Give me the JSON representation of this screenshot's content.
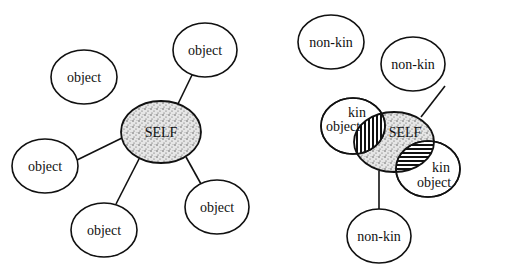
{
  "left_diagram": {
    "self_label": "SELF",
    "objects": [
      {
        "label": "object",
        "connected": false
      },
      {
        "label": "object",
        "connected": true
      },
      {
        "label": "object",
        "connected": true
      },
      {
        "label": "object",
        "connected": true
      },
      {
        "label": "object",
        "connected": true
      }
    ]
  },
  "right_diagram": {
    "self_label": "SELF",
    "non_kin": [
      {
        "label": "non-kin",
        "connected": false
      },
      {
        "label": "non-kin",
        "connected": true
      },
      {
        "label": "non-kin",
        "connected": true
      }
    ],
    "kin_objects": [
      {
        "line1": "kin",
        "line2": "object",
        "overlap_hatch": "vertical"
      },
      {
        "line1": "kin",
        "line2": "object",
        "overlap_hatch": "horizontal"
      }
    ]
  },
  "colors": {
    "stroke": "#111111",
    "background": "#ffffff",
    "self_fill": "#d8d8d8"
  }
}
